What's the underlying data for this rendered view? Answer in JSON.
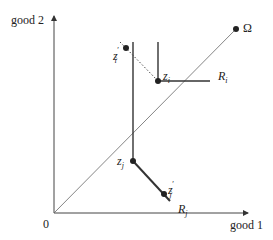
{
  "axes": {
    "x_label": "good 1",
    "y_label": "good 2",
    "origin_label": "0"
  },
  "diagonal": {
    "label": "Ω"
  },
  "points": {
    "zi": {
      "base": "z",
      "sub": "i",
      "sup": ""
    },
    "zi_prime": {
      "base": "z",
      "sub": "i",
      "sup": "′"
    },
    "zj": {
      "base": "z",
      "sub": "j",
      "sup": ""
    },
    "zj_prime": {
      "base": "z",
      "sub": "j",
      "sup": "′"
    }
  },
  "regions": {
    "Ri": {
      "base": "R",
      "sub": "i"
    },
    "Rj": {
      "base": "R",
      "sub": "j"
    }
  },
  "colors": {
    "line": "#333333",
    "thin": "#555555"
  }
}
